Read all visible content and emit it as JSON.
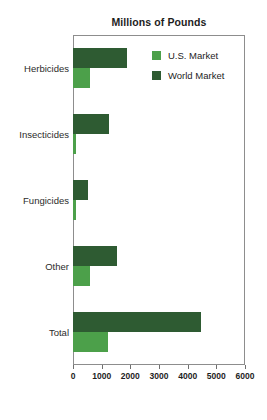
{
  "chart_data": {
    "type": "bar",
    "orientation": "horizontal",
    "title": "Millions of Pounds",
    "xlabel": "",
    "ylabel": "",
    "xlim": [
      0,
      6000
    ],
    "xticks": [
      0,
      1000,
      2000,
      3000,
      4000,
      5000,
      6000
    ],
    "xtick_labels": [
      "0",
      "1000",
      "2000",
      "3000",
      "4000",
      "5000",
      "6000"
    ],
    "grid": false,
    "legend_position": "top-right inside plot",
    "categories": [
      "Herbicides",
      "Insecticides",
      "Fungicides",
      "Other",
      "Total"
    ],
    "series": [
      {
        "name": "U.S. Market",
        "color": "#4CA04A",
        "values": [
          600,
          100,
          90,
          580,
          1220
        ]
      },
      {
        "name": "World Market",
        "color": "#2E5B32",
        "values": [
          1900,
          1250,
          530,
          1550,
          4450
        ]
      }
    ]
  },
  "legend": {
    "items": [
      {
        "label": "U.S. Market",
        "color": "#4CA04A",
        "swatch": "legend-swatch-us"
      },
      {
        "label": "World Market",
        "color": "#2E5B32",
        "swatch": "legend-swatch-world"
      }
    ]
  },
  "axis": {
    "tick_labels": [
      "0",
      "1000",
      "2000",
      "3000",
      "4000",
      "5000",
      "6000"
    ]
  }
}
